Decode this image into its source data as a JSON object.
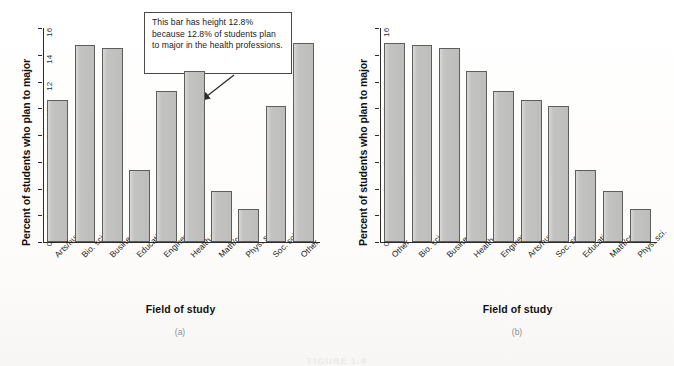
{
  "figure": {
    "caption": "FIGURE 1.4",
    "panel_a_caption": "(a)",
    "panel_b_caption": "(b)"
  },
  "annotation": {
    "text": "This bar has height 12.8% because 12.8% of students plan to major in the health professions.",
    "arrow_name": "callout-arrow",
    "points_to": "Health prof."
  },
  "colors": {
    "bar_fill": "#c3c3c2",
    "bar_border": "#5e5e5e",
    "axis": "#2b2b2b",
    "background": "#fdfdfb",
    "callout_border": "#4a4a4a"
  },
  "chart_data": [
    {
      "type": "bar",
      "panel": "(a)",
      "title": "",
      "xlabel": "Field of study",
      "ylabel": "Percent of students who plan to major",
      "ylim": [
        0,
        16
      ],
      "yticks": [
        0,
        2,
        4,
        6,
        8,
        10,
        12,
        14,
        16
      ],
      "grid": false,
      "legend": "none",
      "categories": [
        "Arts/hum.",
        "Bio. sci.",
        "Business",
        "Education",
        "Engineering",
        "Health prof.",
        "Math/comp.",
        "Phys. sci.",
        "Soc. sci.",
        "Other"
      ],
      "values": [
        10.6,
        14.7,
        14.5,
        5.4,
        11.3,
        12.8,
        3.8,
        2.5,
        10.2,
        14.9
      ]
    },
    {
      "type": "bar",
      "panel": "(b)",
      "title": "",
      "xlabel": "Field of study",
      "ylabel": "Percent of students who plan to major",
      "ylim": [
        0,
        16
      ],
      "yticks": [
        0,
        2,
        4,
        6,
        8,
        10,
        12,
        14,
        16
      ],
      "grid": false,
      "legend": "none",
      "categories": [
        "Other",
        "Bio. sci.",
        "Business",
        "Health prof.",
        "Engineering",
        "Arts/hum.",
        "Soc. sci.",
        "Education",
        "Math/comp.",
        "Phys. sci."
      ],
      "values": [
        14.9,
        14.7,
        14.5,
        12.8,
        11.3,
        10.6,
        10.2,
        5.4,
        3.8,
        2.5
      ]
    }
  ]
}
